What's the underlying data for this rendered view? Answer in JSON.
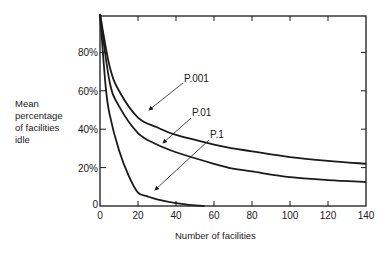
{
  "chart_data": {
    "type": "line",
    "title": "",
    "xlabel": "Number of facilities",
    "ylabel_lines": [
      "Mean",
      "percentage",
      "of facilities",
      "idle"
    ],
    "xlim": [
      0,
      140
    ],
    "ylim": [
      0,
      100
    ],
    "x_ticks": [
      "0",
      "20",
      "40",
      "60",
      "80",
      "100",
      "120",
      "140"
    ],
    "y_ticks": [
      "0",
      "20%",
      "40%",
      "60%",
      "80%"
    ],
    "grid": false,
    "legend": "inline annotations with arrows",
    "series": [
      {
        "name": "P.001",
        "x": [
          0,
          5,
          10,
          20,
          30,
          40,
          60,
          70,
          80,
          100,
          120,
          140
        ],
        "y": [
          100,
          73,
          60,
          46,
          41,
          37,
          32,
          30,
          28.5,
          25.5,
          23.5,
          22
        ]
      },
      {
        "name": "P.01",
        "x": [
          0,
          5,
          10,
          20,
          30,
          40,
          60,
          70,
          80,
          100,
          120,
          140
        ],
        "y": [
          100,
          65,
          52,
          38,
          32,
          28,
          22,
          19.5,
          18,
          15,
          13.5,
          12.5
        ]
      },
      {
        "name": "P.1",
        "x": [
          0,
          3,
          5,
          10,
          15,
          20,
          25,
          30,
          40,
          50,
          55
        ],
        "y": [
          100,
          62,
          48,
          29,
          16,
          7,
          5,
          3.5,
          1.5,
          0.3,
          0
        ]
      }
    ]
  },
  "labels": {
    "xlabel": "Number of facilities",
    "ylabel": [
      "Mean",
      "percentage",
      "of facilities",
      "idle"
    ],
    "series_labels": [
      "P.001",
      "P.01",
      "P.1"
    ]
  }
}
